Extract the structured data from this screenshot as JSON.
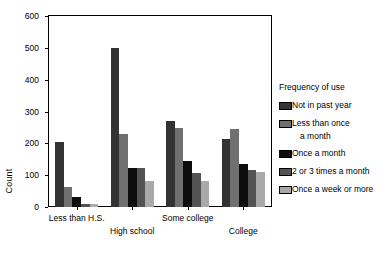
{
  "chart_data": {
    "type": "bar",
    "title": "",
    "xlabel": "",
    "ylabel": "Count",
    "ylim": [
      0,
      600
    ],
    "yticks": [
      0,
      100,
      200,
      300,
      400,
      500,
      600
    ],
    "grid": false,
    "legend_position": "right",
    "legend_title": "Frequency of use",
    "categories": [
      "Less than H.S.",
      "High school",
      "Some college",
      "College"
    ],
    "series": [
      {
        "name": "Not in past year",
        "color": "#333333",
        "values": [
          205,
          500,
          270,
          215
        ]
      },
      {
        "name": "Less than once a month",
        "color": "#707070",
        "values": [
          62,
          228,
          247,
          245
        ]
      },
      {
        "name": "Once a month",
        "color": "#0d0d0d",
        "values": [
          30,
          124,
          145,
          135
        ]
      },
      {
        "name": "2 or 3 times a month",
        "color": "#535353",
        "values": [
          10,
          123,
          107,
          117
        ]
      },
      {
        "name": "Once a week or more",
        "color": "#a9a9a9",
        "values": [
          10,
          82,
          82,
          109
        ]
      }
    ]
  },
  "legend": {
    "title": "Frequency of use",
    "items": [
      {
        "label": "Not in past year",
        "label_cont": "",
        "color": "#333333"
      },
      {
        "label": "Less than once",
        "label_cont": "a month",
        "color": "#707070"
      },
      {
        "label": "Once a month",
        "label_cont": "",
        "color": "#0d0d0d"
      },
      {
        "label": "2 or 3 times a month",
        "label_cont": "",
        "color": "#535353"
      },
      {
        "label": "Once a week or more",
        "label_cont": "",
        "color": "#a9a9a9"
      }
    ]
  },
  "axes": {
    "y_title": "Count",
    "y_labels": [
      "600",
      "500",
      "400",
      "300",
      "200",
      "100",
      "0"
    ],
    "x_labels": [
      "Less than H.S.",
      "High school",
      "Some college",
      "College"
    ]
  }
}
